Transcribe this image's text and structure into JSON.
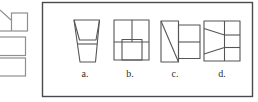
{
  "page": {
    "background": "#ffffff",
    "kind": "test-question-options-figure"
  },
  "answer_box": {
    "border_color": "#4a4a4a",
    "line_color": "#555555",
    "options": [
      {
        "label": "a.",
        "figure": "tapered-cup-frustum-with-inner-rim"
      },
      {
        "label": "b.",
        "figure": "square-two-top-cells-overlapping-bottom-middle-rectangle"
      },
      {
        "label": "c.",
        "figure": "tall-rectangle-with-diagonal-plus-attached-two-cell-rectangle"
      },
      {
        "label": "d.",
        "figure": "square-vertical-divider-three-right-cells-converging-left-diagonals"
      }
    ]
  },
  "left_edge_figures": {
    "line_color": "#8f8f8f",
    "items": [
      {
        "name": "partial-polygon-cut-off"
      },
      {
        "name": "small-square"
      },
      {
        "name": "wide-rectangle-cut-off"
      },
      {
        "name": "wide-rectangle-cut-off"
      }
    ]
  },
  "label_color": "#2f2f2f"
}
